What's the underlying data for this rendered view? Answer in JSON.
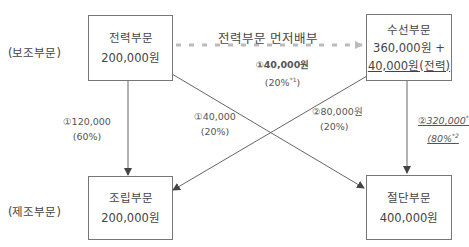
{
  "row_labels": {
    "support": "(보조부문)",
    "production": "(제조부문)"
  },
  "boxes": {
    "electric": {
      "name": "전력부문",
      "amount": "200,000원"
    },
    "repair": {
      "name": "수선부문",
      "amount": "360,000원 +",
      "extra": "40,000원(전력)"
    },
    "assembly": {
      "name": "조립부문",
      "amount": "200,000원"
    },
    "cutting": {
      "name": "절단부문",
      "amount": "400,000원"
    }
  },
  "flows": {
    "priority_title": "전력부문  먼저배부",
    "electric_to_repair": {
      "amount": "①40,000원",
      "pct": "(20%",
      "note": "*1",
      "pct_end": ")"
    },
    "electric_to_assembly": {
      "amount": "①120,000",
      "pct": "(60%)"
    },
    "electric_to_cutting": {
      "amount": "①40,000",
      "pct": "(20%)"
    },
    "repair_to_assembly": {
      "amount": "②80,000원",
      "pct": "(20%)"
    },
    "repair_to_cutting": {
      "amount": "②320,000",
      "amount_note": "*3",
      "pct": "(80%",
      "pct_note": "*2"
    }
  },
  "colors": {
    "line": "#666666",
    "dashed_arrow": "#bbbbbb",
    "box_border": "#777777"
  }
}
